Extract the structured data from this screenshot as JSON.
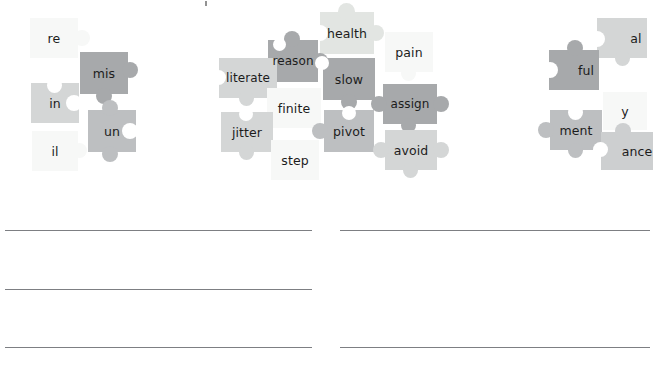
{
  "worksheet": {
    "title": "Word Building Puzzle Worksheet",
    "background_color": "#ffffff",
    "line_color": "#7d7f83"
  },
  "palette": {
    "dark": "#a7a9ab",
    "medium": "#bdbfc1",
    "light": "#d4d6d6",
    "pale": "#e6e8e7",
    "faint": "#f1f2f1",
    "ghost": "#f7f8f7",
    "text": "#1c1c1c"
  },
  "puzzle_groups": [
    {
      "group_name": "prefixes",
      "pieces": [
        {
          "label": "re",
          "tone": "ghost"
        },
        {
          "label": "mis",
          "tone": "dark"
        },
        {
          "label": "in",
          "tone": "light"
        },
        {
          "label": "un",
          "tone": "medium"
        },
        {
          "label": "il",
          "tone": "ghost"
        }
      ]
    },
    {
      "group_name": "roots",
      "pieces": [
        {
          "label": "health",
          "tone": "pale"
        },
        {
          "label": "reason",
          "tone": "dark"
        },
        {
          "label": "pain",
          "tone": "ghost"
        },
        {
          "label": "literate",
          "tone": "light"
        },
        {
          "label": "slow",
          "tone": "dark"
        },
        {
          "label": "finite",
          "tone": "ghost"
        },
        {
          "label": "assign",
          "tone": "dark"
        },
        {
          "label": "jitter",
          "tone": "light"
        },
        {
          "label": "pivot",
          "tone": "medium"
        },
        {
          "label": "avoid",
          "tone": "light"
        },
        {
          "label": "step",
          "tone": "ghost"
        }
      ]
    },
    {
      "group_name": "suffixes",
      "pieces": [
        {
          "label": "al",
          "tone": "light"
        },
        {
          "label": "ful",
          "tone": "dark"
        },
        {
          "label": "y",
          "tone": "ghost"
        },
        {
          "label": "ment",
          "tone": "medium"
        },
        {
          "label": "ance",
          "tone": "light"
        }
      ]
    }
  ],
  "answer_lines": {
    "columns": 2,
    "rows": 3,
    "count": 6,
    "labels": [
      "answer-line-1",
      "answer-line-2",
      "answer-line-3",
      "answer-line-4",
      "answer-line-5",
      "answer-line-6"
    ]
  }
}
